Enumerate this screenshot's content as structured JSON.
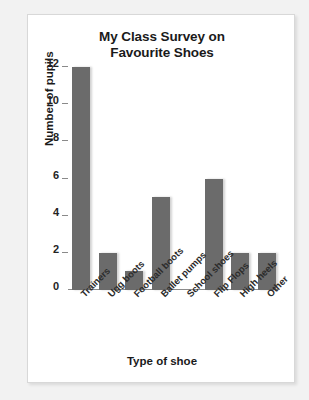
{
  "chart_data": {
    "type": "bar",
    "title": "My Class Survey on Favourite Shoes",
    "title_line1": "My Class Survey on",
    "title_line2": "Favourite Shoes",
    "xlabel": "Type of shoe",
    "ylabel": "Number of pupils",
    "categories": [
      "Trainers",
      "Ugg boots",
      "Football boots",
      "Ballet pumps",
      "School shoes",
      "Flip Flops",
      "High heels",
      "Other"
    ],
    "values": [
      12,
      2,
      1,
      5,
      0,
      6,
      2,
      2
    ],
    "yticks": [
      0,
      2,
      4,
      6,
      8,
      10,
      12
    ],
    "ylim": [
      0,
      12
    ],
    "grid": false,
    "legend": false,
    "bar_color": "#6b6b6b",
    "axis_color": "#8a8a8a",
    "text_color": "#1a1a1a",
    "panel_background": "#ffffff",
    "page_background": "#f2f2f2"
  }
}
